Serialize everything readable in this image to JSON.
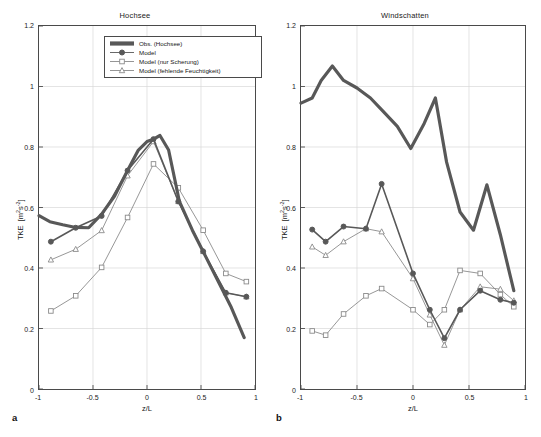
{
  "figure": {
    "panel_letters": [
      "a",
      "b"
    ],
    "axis": {
      "xlabel": "z/L",
      "ylabel_main": "TKE",
      "ylabel_units": "[m2s-2]",
      "xticks": [
        "-1",
        "-0.5",
        "0",
        "0.5",
        "1"
      ],
      "xtick_values": [
        -1,
        -0.5,
        0,
        0.5,
        1
      ],
      "yticks": [
        "0",
        "0.2",
        "0.4",
        "0.6",
        "0.8",
        "1",
        "1.2"
      ],
      "ytick_values": [
        0,
        0.2,
        0.4,
        0.6,
        0.8,
        1,
        1.2
      ],
      "xlim": [
        -1,
        1
      ],
      "ylim": [
        0,
        1.2
      ]
    },
    "legend": {
      "position": "top-right-panel-a",
      "entries": [
        {
          "label": "Obs. (Hochsee)",
          "style": "thick-line",
          "marker": "none",
          "color": "#585858"
        },
        {
          "label": "Model",
          "style": "line-marker",
          "marker": "circle-filled",
          "color": "#585858"
        },
        {
          "label": "Model (nur Scherung)",
          "style": "line-marker",
          "marker": "square-open",
          "color": "#8a8a8a"
        },
        {
          "label": "Model (fehlende Feuchtigkeit)",
          "style": "line-marker",
          "marker": "triangle-open",
          "color": "#8a8a8a"
        }
      ]
    }
  },
  "chart_data": [
    {
      "type": "line",
      "panel": "a",
      "title": "Hochsee",
      "xlabel": "z/L",
      "ylabel": "TKE [m2s-2]",
      "xlim": [
        -1,
        1
      ],
      "ylim": [
        0,
        1.2
      ],
      "grid": true,
      "series": [
        {
          "name": "Obs. (Hochsee)",
          "marker": "none",
          "width": 3.2,
          "color": "#585858",
          "x": [
            -1.0,
            -0.9,
            -0.78,
            -0.66,
            -0.54,
            -0.42,
            -0.3,
            -0.18,
            -0.08,
            0.0,
            0.06,
            0.12,
            0.2,
            0.3,
            0.42,
            0.54,
            0.66,
            0.78,
            0.9
          ],
          "y": [
            0.573,
            0.553,
            0.543,
            0.534,
            0.533,
            0.578,
            0.638,
            0.722,
            0.79,
            0.818,
            0.826,
            0.838,
            0.79,
            0.62,
            0.525,
            0.44,
            0.355,
            0.27,
            0.17
          ]
        },
        {
          "name": "Model",
          "marker": "circle-filled",
          "width": 1.6,
          "color": "#585858",
          "x": [
            -0.89,
            -0.66,
            -0.42,
            -0.18,
            0.06,
            0.29,
            0.52,
            0.73,
            0.92
          ],
          "y": [
            0.487,
            0.533,
            0.572,
            0.722,
            0.826,
            0.62,
            0.455,
            0.318,
            0.305
          ]
        },
        {
          "name": "Model (nur Scherung)",
          "marker": "square-open",
          "width": 0.9,
          "color": "#8a8a8a",
          "x": [
            -0.89,
            -0.66,
            -0.42,
            -0.18,
            0.06,
            0.29,
            0.52,
            0.73,
            0.92
          ],
          "y": [
            0.258,
            0.308,
            0.402,
            0.567,
            0.744,
            0.665,
            0.525,
            0.382,
            0.355
          ]
        },
        {
          "name": "Model (fehlende Feuchtigkeit)",
          "marker": "triangle-open",
          "width": 0.9,
          "color": "#8a8a8a",
          "x": [
            -0.89,
            -0.66,
            -0.42,
            -0.18,
            0.06,
            0.29,
            0.52,
            0.73,
            0.92
          ],
          "y": [
            0.427,
            0.462,
            0.524,
            0.705,
            0.818,
            0.62,
            0.455,
            0.318,
            0.305
          ]
        }
      ]
    },
    {
      "type": "line",
      "panel": "b",
      "title": "Windschatten",
      "xlabel": "z/L",
      "ylabel": "TKE [m2s-2]",
      "xlim": [
        -1,
        1
      ],
      "ylim": [
        0,
        1.2
      ],
      "grid": true,
      "series": [
        {
          "name": "Obs. (Windschatten)",
          "marker": "none",
          "width": 3.2,
          "color": "#585858",
          "x": [
            -1.0,
            -0.9,
            -0.82,
            -0.72,
            -0.62,
            -0.5,
            -0.38,
            -0.26,
            -0.14,
            -0.02,
            0.1,
            0.2,
            0.3,
            0.42,
            0.54,
            0.66,
            0.78,
            0.9
          ],
          "y": [
            0.945,
            0.962,
            1.02,
            1.068,
            1.02,
            0.995,
            0.962,
            0.915,
            0.868,
            0.795,
            0.878,
            0.962,
            0.75,
            0.585,
            0.525,
            0.675,
            0.51,
            0.325
          ]
        },
        {
          "name": "Model",
          "marker": "circle-filled",
          "width": 1.6,
          "color": "#585858",
          "x": [
            -0.9,
            -0.78,
            -0.62,
            -0.42,
            -0.28,
            0.0,
            0.15,
            0.28,
            0.42,
            0.6,
            0.78,
            0.9
          ],
          "y": [
            0.527,
            0.487,
            0.537,
            0.53,
            0.678,
            0.382,
            0.262,
            0.168,
            0.262,
            0.325,
            0.295,
            0.285
          ]
        },
        {
          "name": "Model (nur Scherung)",
          "marker": "square-open",
          "width": 0.9,
          "color": "#8a8a8a",
          "x": [
            -0.9,
            -0.78,
            -0.62,
            -0.42,
            -0.28,
            0.0,
            0.15,
            0.28,
            0.42,
            0.6,
            0.78,
            0.9
          ],
          "y": [
            0.192,
            0.178,
            0.248,
            0.308,
            0.332,
            0.262,
            0.213,
            0.262,
            0.392,
            0.382,
            0.312,
            0.272
          ]
        },
        {
          "name": "Model (fehlende Feuchtigkeit)",
          "marker": "triangle-open",
          "width": 0.9,
          "color": "#8a8a8a",
          "x": [
            -0.9,
            -0.78,
            -0.62,
            -0.42,
            -0.28,
            0.0,
            0.15,
            0.28,
            0.42,
            0.6,
            0.78,
            0.9
          ],
          "y": [
            0.47,
            0.442,
            0.487,
            0.53,
            0.52,
            0.365,
            0.245,
            0.145,
            0.262,
            0.338,
            0.33,
            0.292
          ]
        }
      ]
    }
  ]
}
